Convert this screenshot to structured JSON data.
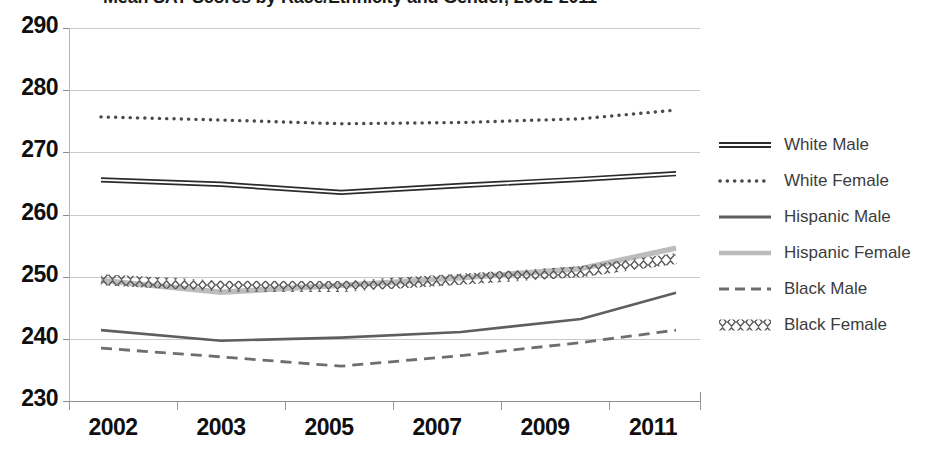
{
  "chart_data": {
    "type": "line",
    "title": "Mean SAT Scores by Race/Ethnicity and Gender, 2002-2011",
    "xlabel": "",
    "ylabel": "",
    "categories": [
      "2002",
      "2003",
      "2005",
      "2007",
      "2009",
      "2011"
    ],
    "x_positions": [
      101,
      221,
      341,
      461,
      581,
      676
    ],
    "ylim": [
      230,
      290
    ],
    "yticks": [
      230,
      240,
      250,
      260,
      270,
      280,
      290
    ],
    "grid": true,
    "legend_position": "right",
    "series": [
      {
        "name": "White Male",
        "style": "thick-double-solid",
        "color": "#2b2b2b",
        "values": [
          265.5,
          264.8,
          263.5,
          264.6,
          265.6,
          266.5
        ]
      },
      {
        "name": "White Female",
        "style": "dotted",
        "color": "#4a4a4a",
        "values": [
          275.7,
          275.2,
          274.6,
          274.8,
          275.4,
          276.8
        ]
      },
      {
        "name": "Hispanic Male",
        "style": "solid",
        "color": "#5e5e5e",
        "values": [
          241.4,
          239.7,
          240.2,
          241.1,
          243.2,
          247.4
        ]
      },
      {
        "name": "Hispanic Female",
        "style": "solid-light",
        "color": "#bcbcbc",
        "values": [
          249.4,
          247.5,
          248.6,
          249.8,
          251.3,
          254.6
        ]
      },
      {
        "name": "Black Male",
        "style": "dashed",
        "color": "#6e6e6e",
        "values": [
          238.5,
          237.1,
          235.6,
          237.3,
          239.4,
          241.4
        ]
      },
      {
        "name": "Black Female",
        "style": "diamond-chain",
        "color": "#5a5a5a",
        "values": [
          249.5,
          248.5,
          248.4,
          249.6,
          250.8,
          252.9
        ]
      }
    ]
  },
  "y_axis": {
    "labels": [
      "290",
      "280",
      "270",
      "260",
      "250",
      "240",
      "230"
    ]
  },
  "x_axis": {
    "labels": [
      "2002",
      "2003",
      "2005",
      "2007",
      "2009",
      "2011"
    ]
  },
  "legend": {
    "items": [
      {
        "label": "White Male"
      },
      {
        "label": "White Female"
      },
      {
        "label": "Hispanic Male"
      },
      {
        "label": "Hispanic Female"
      },
      {
        "label": "Black Male"
      },
      {
        "label": "Black Female"
      }
    ]
  }
}
